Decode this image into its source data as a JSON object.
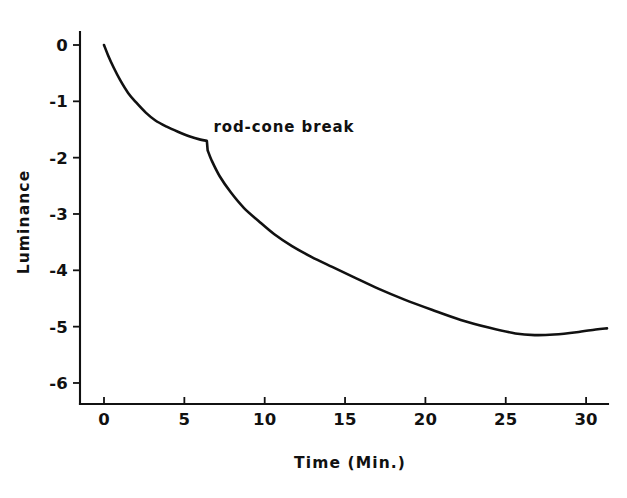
{
  "chart_data": {
    "type": "line",
    "title": "",
    "xlabel": "Time (Min.)",
    "ylabel": "Luminance",
    "xlim": [
      -0.9,
      32.5
    ],
    "ylim": [
      -6.6,
      0.55
    ],
    "grid": false,
    "legend": null,
    "x_ticks": [
      0,
      5,
      10,
      15,
      20,
      25,
      30
    ],
    "x_tick_labels": [
      "0",
      "5",
      "10",
      "15",
      "20",
      "25",
      "30"
    ],
    "y_ticks": [
      0,
      -1,
      -2,
      -3,
      -4,
      -5,
      -6
    ],
    "y_tick_labels": [
      "0",
      "-1",
      "-2",
      "-3",
      "-4",
      "-5",
      "-6"
    ],
    "annotations": [
      {
        "text": "rod-cone break",
        "x": 6.5,
        "y": -1.45,
        "target_x": 6.4,
        "target_y": -1.7
      }
    ],
    "series": [
      {
        "name": "dark adaptation",
        "color": "#111111",
        "x": [
          0.0,
          0.25,
          0.6,
          1.0,
          1.5,
          2.0,
          2.6,
          3.2,
          3.9,
          4.6,
          5.3,
          6.0,
          6.4,
          6.45,
          6.7,
          7.2,
          7.9,
          8.7,
          9.6,
          10.6,
          11.7,
          12.9,
          14.2,
          15.6,
          17.1,
          18.7,
          20.4,
          22.2,
          24.0,
          25.6,
          26.8,
          28.0,
          29.4,
          30.6,
          31.3
        ],
        "y": [
          0.0,
          -0.18,
          -0.4,
          -0.62,
          -0.85,
          -1.02,
          -1.2,
          -1.34,
          -1.45,
          -1.54,
          -1.62,
          -1.68,
          -1.7,
          -1.87,
          -2.05,
          -2.33,
          -2.62,
          -2.89,
          -3.12,
          -3.36,
          -3.57,
          -3.76,
          -3.94,
          -4.13,
          -4.33,
          -4.52,
          -4.7,
          -4.88,
          -5.02,
          -5.12,
          -5.15,
          -5.14,
          -5.1,
          -5.05,
          -5.03
        ]
      }
    ]
  },
  "axis_geometry": {
    "x0_px": 104,
    "x_px_per_unit": 16.07,
    "y0_px": 45,
    "y_px_per_unit": 56.33,
    "x_axis_y_px": 404,
    "y_axis_x_px": 80,
    "x_axis_left_px": 80,
    "x_axis_right_px": 608,
    "y_axis_top_px": 32,
    "tick_len_px": 7
  },
  "styling": {
    "background": "#ffffff",
    "ink": "#111111"
  }
}
